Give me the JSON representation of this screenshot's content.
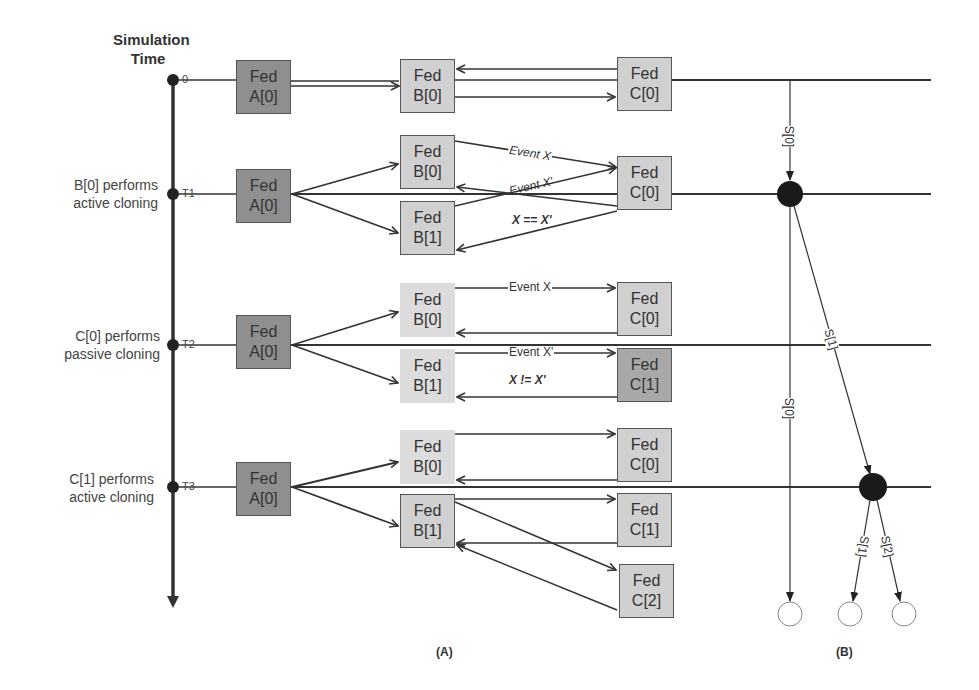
{
  "axis": {
    "title_line1": "Simulation",
    "title_line2": "Time",
    "ticks": [
      "0",
      "T1",
      "T2",
      "T3"
    ]
  },
  "rows": [
    {
      "label_line1": "",
      "label_line2": ""
    },
    {
      "label_line1": "B[0] performs",
      "label_line2": "active cloning"
    },
    {
      "label_line1": "C[0] performs",
      "label_line2": "passive cloning"
    },
    {
      "label_line1": "C[1] performs",
      "label_line2": "active cloning"
    }
  ],
  "boxes": {
    "fed": "Fed",
    "r0": {
      "a": "A[0]",
      "b0": "B[0]",
      "c0": "C[0]"
    },
    "r1": {
      "a": "A[0]",
      "b0": "B[0]",
      "b1": "B[1]",
      "c0": "C[0]"
    },
    "r2": {
      "a": "A[0]",
      "b0": "B[0]",
      "b1": "B[1]",
      "c0": "C[0]",
      "c1": "C[1]"
    },
    "r3": {
      "a": "A[0]",
      "b0": "B[0]",
      "b1": "B[1]",
      "c0": "C[0]",
      "c1": "C[1]",
      "c2": "C[2]"
    }
  },
  "events": {
    "r1_x": "Event X",
    "r1_xp": "Event X'",
    "r1_eq": "X == X'",
    "r2_x": "Event X",
    "r2_xp": "Event X'",
    "r2_neq": "X != X'"
  },
  "panel_b": {
    "edges": [
      "S[0]",
      "S[1]",
      "S[0]",
      "S[1]",
      "S[2]"
    ]
  },
  "captions": {
    "a": "(A)",
    "b": "(B)"
  },
  "colors": {
    "federate_dark": "#8f8f8f",
    "federate_light": "#d0d0d0",
    "line": "#333333"
  }
}
